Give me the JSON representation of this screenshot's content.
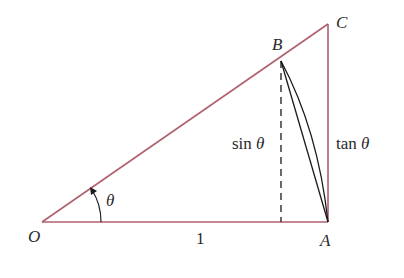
{
  "diagram": {
    "colors": {
      "triangle_stroke": "#b0606e",
      "chord_stroke": "#1a1a1a",
      "text": "#2a2a2a"
    },
    "points": {
      "O": {
        "label": "O"
      },
      "A": {
        "label": "A"
      },
      "B": {
        "label": "B"
      },
      "C": {
        "label": "C"
      }
    },
    "labels": {
      "angle": "θ",
      "base_length": "1",
      "sin_fn": "sin",
      "sin_var": "θ",
      "tan_fn": "tan",
      "tan_var": "θ"
    }
  }
}
